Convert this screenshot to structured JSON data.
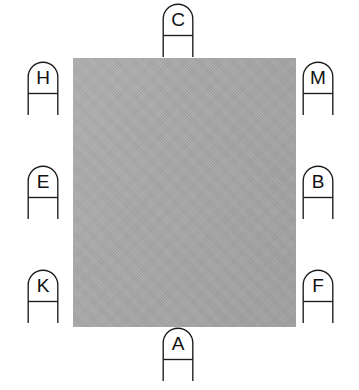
{
  "figure": {
    "type": "technical-reference-diagram",
    "width": 359,
    "height": 390,
    "background_color": "#ffffff",
    "panel": {
      "label": "gray rectangular panel",
      "fill_color": "#a7a7a7",
      "x": 73,
      "y": 58,
      "width": 223,
      "height": 269
    },
    "callout_shape": {
      "description": "arch-topped reference marker with horizontal rule under letter and two vertical legs",
      "stroke_color": "#1b1b1b",
      "text_color": "#111111"
    },
    "callouts": [
      {
        "id": "c",
        "label": "C",
        "position": "top-center",
        "x": 162,
        "y": 4
      },
      {
        "id": "h",
        "label": "H",
        "position": "left-upper",
        "x": 27,
        "y": 62
      },
      {
        "id": "m",
        "label": "M",
        "position": "right-upper",
        "x": 302,
        "y": 62
      },
      {
        "id": "e",
        "label": "E",
        "position": "left-middle",
        "x": 27,
        "y": 166
      },
      {
        "id": "b",
        "label": "B",
        "position": "right-middle",
        "x": 302,
        "y": 166
      },
      {
        "id": "k",
        "label": "K",
        "position": "left-lower",
        "x": 27,
        "y": 270
      },
      {
        "id": "f",
        "label": "F",
        "position": "right-lower",
        "x": 302,
        "y": 270
      },
      {
        "id": "a",
        "label": "A",
        "position": "bottom-center",
        "x": 162,
        "y": 328
      }
    ]
  }
}
